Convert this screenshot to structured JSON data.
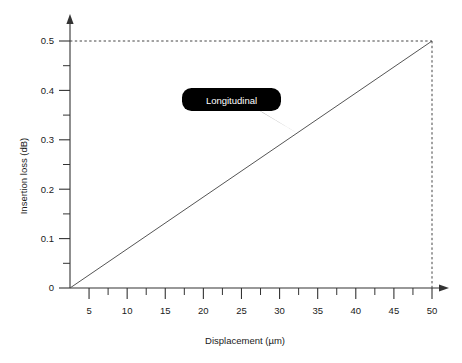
{
  "chart_data": {
    "type": "line",
    "title": "",
    "xlabel": "Displacement (µm)",
    "ylabel": "Insertion loss (dB)",
    "xlim": [
      2.5,
      52.5
    ],
    "ylim": [
      0,
      0.55
    ],
    "grid": false,
    "legend": "none",
    "x_ticks": [
      5,
      10,
      15,
      20,
      25,
      30,
      35,
      40,
      45,
      50
    ],
    "x_tick_labels": [
      "5",
      "10",
      "15",
      "20",
      "25",
      "30",
      "35",
      "40",
      "45",
      "50"
    ],
    "x_minor_ticks": [
      7.5,
      12.5,
      17.5,
      22.5,
      27.5,
      32.5,
      37.5,
      42.5,
      47.5
    ],
    "y_ticks": [
      0,
      0.1,
      0.2,
      0.3,
      0.4,
      0.5
    ],
    "y_tick_labels": [
      "0",
      "0.1",
      "0.2",
      "0.3",
      "0.4",
      "0.5"
    ],
    "y_minor_ticks": [
      0.05,
      0.15,
      0.25,
      0.35,
      0.45
    ],
    "series": [
      {
        "name": "Longitudinal",
        "x": [
          2.5,
          50
        ],
        "values": [
          0,
          0.5
        ],
        "color": "#555555"
      }
    ],
    "annotations": [
      {
        "text": "Longitudinal",
        "kind": "callout-bubble",
        "target_x": 33,
        "target_y": 0.32,
        "fill": "#000000",
        "text_color": "#ffffff"
      }
    ],
    "reference_lines": [
      {
        "orientation": "horizontal",
        "value": 0.5,
        "style": "dashed",
        "color": "#444444"
      },
      {
        "orientation": "vertical",
        "value": 50,
        "style": "dashed",
        "color": "#444444"
      }
    ]
  },
  "axes": {
    "x_axis_name": "Displacement (µm)",
    "y_axis_name": "Insertion loss (dB)"
  },
  "colors": {
    "axis": "#333333",
    "line": "#555555",
    "dash": "#444444",
    "callout_fill": "#000000",
    "callout_text": "#ffffff",
    "background": "#ffffff"
  }
}
